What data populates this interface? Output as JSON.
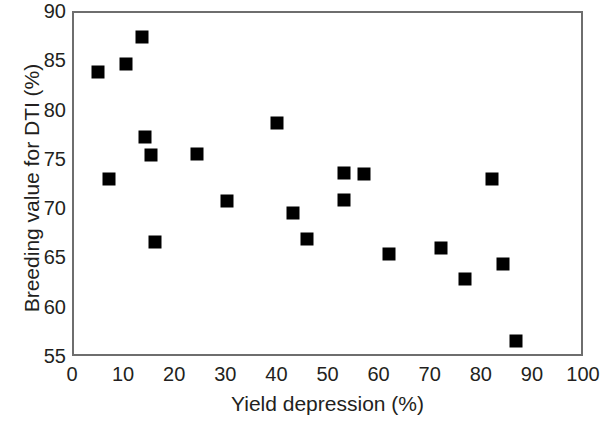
{
  "chart_data": {
    "type": "scatter",
    "title": "",
    "xlabel": "Yield depression (%)",
    "ylabel": "Breeding value for DTI (%)",
    "xlim": [
      0,
      100
    ],
    "ylim": [
      55,
      90
    ],
    "xticks": [
      "0",
      "10",
      "20",
      "30",
      "40",
      "50",
      "60",
      "70",
      "80",
      "90",
      "100"
    ],
    "xtick_values": [
      0,
      10,
      20,
      30,
      40,
      50,
      60,
      70,
      80,
      90,
      100
    ],
    "yticks": [
      "55",
      "60",
      "65",
      "70",
      "75",
      "80",
      "85",
      "90"
    ],
    "ytick_values": [
      55,
      60,
      65,
      70,
      75,
      80,
      85,
      90
    ],
    "grid": false,
    "legend": null,
    "marker": "square",
    "marker_color": "#000000",
    "marker_size_px": 13,
    "frame_color": "#6e6e6e",
    "background": "#ffffff",
    "series": [
      {
        "name": "Breeding value for DTI",
        "points": [
          {
            "x": 4.7,
            "y": 84.0
          },
          {
            "x": 6.8,
            "y": 73.2
          },
          {
            "x": 10.2,
            "y": 84.8
          },
          {
            "x": 13.4,
            "y": 87.6
          },
          {
            "x": 13.9,
            "y": 77.4
          },
          {
            "x": 15.1,
            "y": 75.6
          },
          {
            "x": 15.9,
            "y": 66.8
          },
          {
            "x": 24.1,
            "y": 75.7
          },
          {
            "x": 29.9,
            "y": 70.9
          },
          {
            "x": 39.7,
            "y": 78.8
          },
          {
            "x": 42.9,
            "y": 69.7
          },
          {
            "x": 45.6,
            "y": 67.1
          },
          {
            "x": 52.8,
            "y": 73.8
          },
          {
            "x": 52.8,
            "y": 71.0
          },
          {
            "x": 56.8,
            "y": 73.7
          },
          {
            "x": 61.6,
            "y": 65.6
          },
          {
            "x": 71.8,
            "y": 66.2
          },
          {
            "x": 76.5,
            "y": 63.0
          },
          {
            "x": 81.8,
            "y": 73.2
          },
          {
            "x": 84.0,
            "y": 64.5
          },
          {
            "x": 86.5,
            "y": 56.7
          }
        ]
      }
    ]
  }
}
